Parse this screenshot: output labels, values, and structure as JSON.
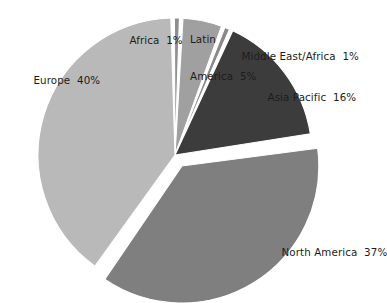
{
  "chart_data": {
    "type": "pie",
    "title": "",
    "subtitle": "",
    "xlabel": "",
    "ylabel": "",
    "legend_position": "none",
    "grid": false,
    "units": "percent",
    "categories": [
      "Europe",
      "Africa",
      "Latin America",
      "Middle East/Africa",
      "Asia Pacific",
      "North America"
    ],
    "values": [
      40,
      1,
      5,
      1,
      16,
      37
    ],
    "slices": [
      {
        "name": "Europe",
        "label": "Europe",
        "value": 40,
        "value_text": "40%",
        "color": "#b9b9b9",
        "exploded": false
      },
      {
        "name": "Africa",
        "label": "Africa",
        "value": 1,
        "value_text": "1%",
        "color": "#8f8f8f",
        "exploded": false
      },
      {
        "name": "Latin America",
        "label": "Latin\nAmerica",
        "label_line1": "Latin",
        "label_line2": "America",
        "value": 5,
        "value_text": "5%",
        "color": "#a0a0a0",
        "exploded": false
      },
      {
        "name": "Middle East/Africa",
        "label": "Middle East/Africa",
        "value": 1,
        "value_text": "1%",
        "color": "#8a8a8a",
        "exploded": false
      },
      {
        "name": "Asia Pacific",
        "label": "Asia Pacific",
        "value": 16,
        "value_text": "16%",
        "color": "#3c3c3c",
        "exploded": false
      },
      {
        "name": "North America",
        "label": "North America",
        "value": 37,
        "value_text": "37%",
        "color": "#7f7f7f",
        "exploded": true
      }
    ]
  },
  "labels": {
    "europe": "Europe  40%",
    "africa": "Africa  1%",
    "latin_line1": "Latin",
    "latin_line2": "America  5%",
    "middle_east_africa": "Middle East/Africa  1%",
    "asia_pacific": "Asia Pacific  16%",
    "north_america": "North America  37%"
  },
  "colors": {
    "background": "#ffffff",
    "text": "#1c1c1c",
    "slice_border": "#ffffff",
    "europe": "#b9b9b9",
    "africa": "#8f8f8f",
    "latin_america": "#a0a0a0",
    "middle_east_africa": "#8a8a8a",
    "asia_pacific": "#3c3c3c",
    "north_america": "#7f7f7f"
  }
}
